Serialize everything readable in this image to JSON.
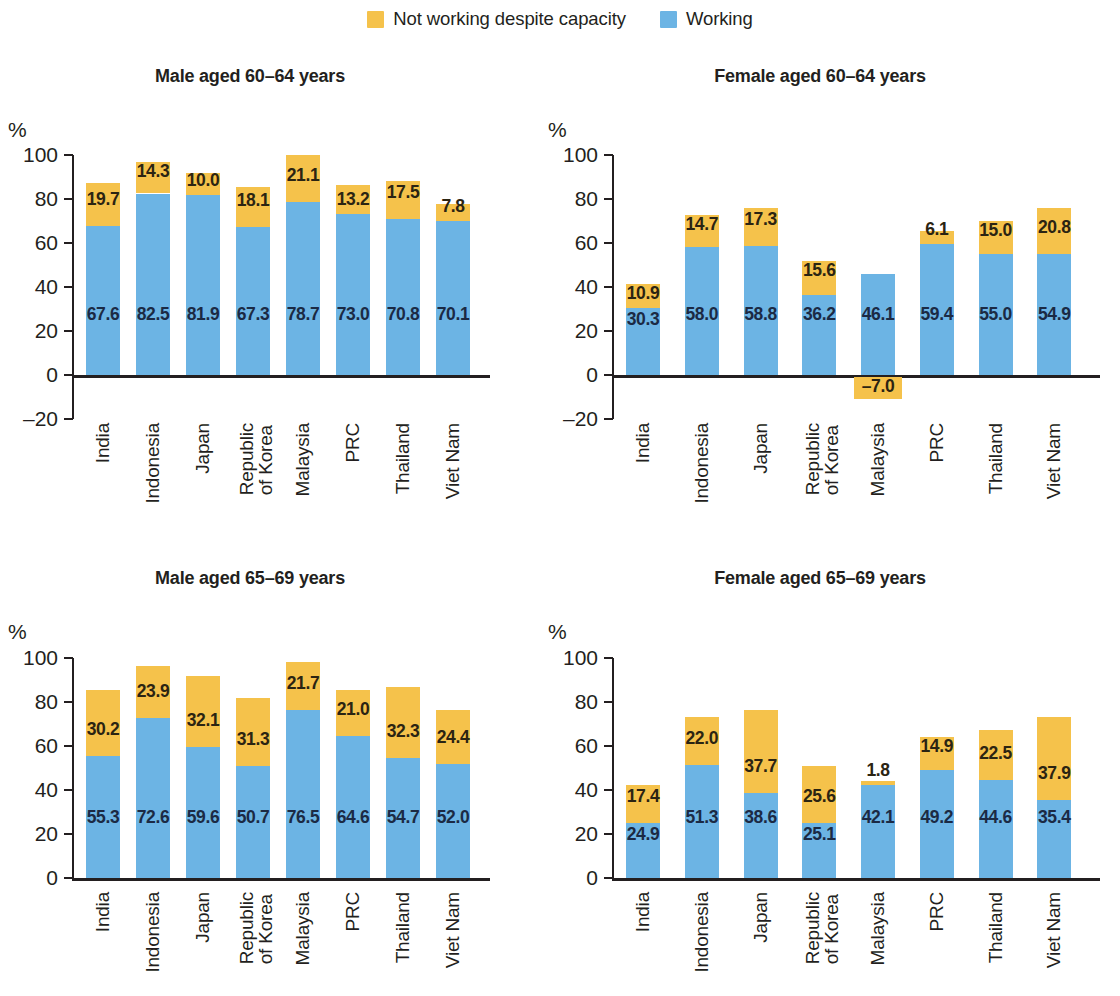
{
  "legend": {
    "entries": [
      {
        "label": "Not working despite capacity",
        "color": "#f5c24b",
        "icon": "square-swatch"
      },
      {
        "label": "Working",
        "color": "#6cb4e4",
        "icon": "square-swatch"
      }
    ]
  },
  "colors": {
    "not_working": "#f5c24b",
    "working": "#6cb4e4",
    "axis": "#231f20",
    "text": "#231f20"
  },
  "axis_unit": "%",
  "categories": [
    "India",
    "Indonesia",
    "Japan",
    "Republic\nof Korea",
    "Malaysia",
    "PRC",
    "Thailand",
    "Viet Nam"
  ],
  "chart_data": [
    {
      "type": "bar",
      "stacked": true,
      "title": "Male aged 60–64 years",
      "xlabel": "",
      "ylabel": "%",
      "ylim": [
        -20,
        100
      ],
      "yticks": [
        -20,
        0,
        20,
        40,
        60,
        80,
        100
      ],
      "ytick_labels": [
        "–20",
        "0",
        "20",
        "40",
        "60",
        "80",
        "100"
      ],
      "grid": false,
      "legend_position": "top-center",
      "categories": [
        "India",
        "Indonesia",
        "Japan",
        "Republic of Korea",
        "Malaysia",
        "PRC",
        "Thailand",
        "Viet Nam"
      ],
      "series": [
        {
          "name": "Working",
          "color": "#6cb4e4",
          "values": [
            67.6,
            82.5,
            81.9,
            67.3,
            78.7,
            73.0,
            70.8,
            70.1
          ]
        },
        {
          "name": "Not working despite capacity",
          "color": "#f5c24b",
          "values": [
            19.7,
            14.3,
            10.0,
            18.1,
            21.1,
            13.2,
            17.5,
            7.8
          ]
        }
      ]
    },
    {
      "type": "bar",
      "stacked": true,
      "title": "Female aged 60–64 years",
      "xlabel": "",
      "ylabel": "%",
      "ylim": [
        -20,
        100
      ],
      "yticks": [
        -20,
        0,
        20,
        40,
        60,
        80,
        100
      ],
      "ytick_labels": [
        "–20",
        "0",
        "20",
        "40",
        "60",
        "80",
        "100"
      ],
      "grid": false,
      "legend_position": "top-center",
      "categories": [
        "India",
        "Indonesia",
        "Japan",
        "Republic of Korea",
        "Malaysia",
        "PRC",
        "Thailand",
        "Viet Nam"
      ],
      "series": [
        {
          "name": "Working",
          "color": "#6cb4e4",
          "values": [
            30.3,
            58.0,
            58.8,
            36.2,
            46.1,
            59.4,
            55.0,
            54.9
          ]
        },
        {
          "name": "Not working despite capacity",
          "color": "#f5c24b",
          "values": [
            10.9,
            14.7,
            17.3,
            15.6,
            -7.0,
            6.1,
            15.0,
            20.8
          ]
        }
      ]
    },
    {
      "type": "bar",
      "stacked": true,
      "title": "Male aged 65–69 years",
      "xlabel": "",
      "ylabel": "%",
      "ylim": [
        0,
        100
      ],
      "yticks": [
        0,
        20,
        40,
        60,
        80,
        100
      ],
      "ytick_labels": [
        "0",
        "20",
        "40",
        "60",
        "80",
        "100"
      ],
      "grid": false,
      "legend_position": "top-center",
      "categories": [
        "India",
        "Indonesia",
        "Japan",
        "Republic of Korea",
        "Malaysia",
        "PRC",
        "Thailand",
        "Viet Nam"
      ],
      "series": [
        {
          "name": "Working",
          "color": "#6cb4e4",
          "values": [
            55.3,
            72.6,
            59.6,
            50.7,
            76.5,
            64.6,
            54.7,
            52.0
          ]
        },
        {
          "name": "Not working despite capacity",
          "color": "#f5c24b",
          "values": [
            30.2,
            23.9,
            32.1,
            31.3,
            21.7,
            21.0,
            32.3,
            24.4
          ]
        }
      ]
    },
    {
      "type": "bar",
      "stacked": true,
      "title": "Female aged 65–69 years",
      "xlabel": "",
      "ylabel": "%",
      "ylim": [
        0,
        100
      ],
      "yticks": [
        0,
        20,
        40,
        60,
        80,
        100
      ],
      "ytick_labels": [
        "0",
        "20",
        "40",
        "60",
        "80",
        "100"
      ],
      "grid": false,
      "legend_position": "top-center",
      "categories": [
        "India",
        "Indonesia",
        "Japan",
        "Republic of Korea",
        "Malaysia",
        "PRC",
        "Thailand",
        "Viet Nam"
      ],
      "series": [
        {
          "name": "Working",
          "color": "#6cb4e4",
          "values": [
            24.9,
            51.3,
            38.6,
            25.1,
            42.1,
            49.2,
            44.6,
            35.4
          ]
        },
        {
          "name": "Not working despite capacity",
          "color": "#f5c24b",
          "values": [
            17.4,
            22.0,
            37.7,
            25.6,
            1.8,
            14.9,
            22.5,
            37.9
          ]
        }
      ]
    }
  ]
}
